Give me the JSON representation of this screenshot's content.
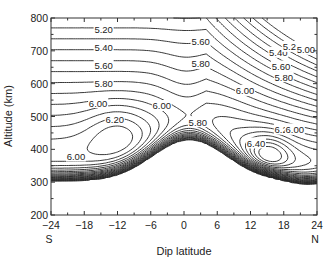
{
  "chart_data": {
    "type": "contour",
    "title": "",
    "xlabel": "Dip latitude",
    "ylabel": "Altitude (km)",
    "xlim": [
      -24,
      24
    ],
    "ylim": [
      200,
      800
    ],
    "x_ticks": [
      "-24",
      "-18",
      "-12",
      "-6",
      "0",
      "6",
      "12",
      "18",
      "24"
    ],
    "y_ticks": [
      "200",
      "300",
      "400",
      "500",
      "600",
      "700",
      "800"
    ],
    "x_end_labels": {
      "left": "S",
      "right": "N"
    },
    "contour_levels": [
      5.0,
      5.2,
      5.4,
      5.6,
      5.8,
      6.0,
      6.2,
      6.4
    ],
    "contour_labels": [
      {
        "text": "5.20",
        "x": -14.5,
        "y": 764
      },
      {
        "text": "5.40",
        "x": -14.5,
        "y": 711
      },
      {
        "text": "5.60",
        "x": -14.5,
        "y": 656
      },
      {
        "text": "5.80",
        "x": -14.5,
        "y": 601
      },
      {
        "text": "6.00",
        "x": -15.5,
        "y": 541
      },
      {
        "text": "6.20",
        "x": -12.5,
        "y": 490
      },
      {
        "text": "6.00",
        "x": -4.0,
        "y": 532
      },
      {
        "text": "6.00",
        "x": -19.5,
        "y": 378
      },
      {
        "text": "5.60",
        "x": 3.0,
        "y": 728
      },
      {
        "text": "5.80",
        "x": 3.0,
        "y": 660
      },
      {
        "text": "5.80",
        "x": 2.5,
        "y": 483
      },
      {
        "text": "6.00",
        "x": 11.0,
        "y": 578
      },
      {
        "text": "5.40",
        "x": 17.0,
        "y": 694
      },
      {
        "text": "5.20",
        "x": 19.5,
        "y": 712
      },
      {
        "text": "5.00",
        "x": 22.0,
        "y": 703
      },
      {
        "text": "5.60",
        "x": 17.5,
        "y": 652
      },
      {
        "text": "5.80",
        "x": 18.0,
        "y": 620
      },
      {
        "text": "6.40",
        "x": 13.0,
        "y": 418
      },
      {
        "text": "6.20",
        "x": 18.0,
        "y": 460
      },
      {
        "text": "6.00",
        "x": 20.0,
        "y": 460
      }
    ],
    "features": {
      "south_maximum": {
        "lat": -12,
        "alt": 450,
        "value_above": 6.2
      },
      "north_maximum": {
        "lat": 15,
        "alt": 360,
        "value_above": 6.4
      },
      "trough": {
        "lat": 1,
        "alt": 420
      }
    },
    "grid": false,
    "legend": null
  }
}
